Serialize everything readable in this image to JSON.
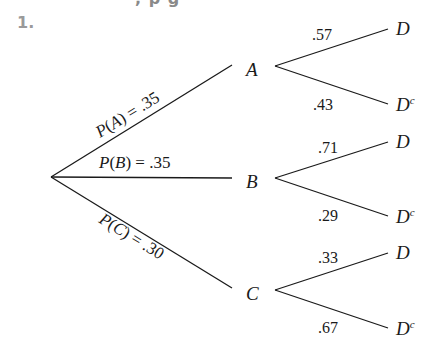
{
  "header": {
    "problem_number": "1.",
    "cut_off_text": ", p g"
  },
  "tree": {
    "root": {
      "x": 51,
      "y": 177
    },
    "first_level": [
      {
        "event": "A",
        "label": "P(A) = .35",
        "probability": 0.35,
        "branches": [
          {
            "outcome": "D",
            "prob_label": ".57",
            "probability": 0.57
          },
          {
            "outcome": "Dc",
            "prob_label": ".43",
            "probability": 0.43
          }
        ]
      },
      {
        "event": "B",
        "label": "P(B) = .35",
        "probability": 0.35,
        "branches": [
          {
            "outcome": "D",
            "prob_label": ".71",
            "probability": 0.71
          },
          {
            "outcome": "Dc",
            "prob_label": ".29",
            "probability": 0.29
          }
        ]
      },
      {
        "event": "C",
        "label": "P(C) = .30",
        "probability": 0.3,
        "branches": [
          {
            "outcome": "D",
            "prob_label": ".33",
            "probability": 0.33
          },
          {
            "outcome": "Dc",
            "prob_label": ".67",
            "probability": 0.67
          }
        ]
      }
    ],
    "labels": {
      "A": "A",
      "B": "B",
      "C": "C",
      "D": "D",
      "D_base": "D",
      "complement_sup": "c"
    }
  }
}
